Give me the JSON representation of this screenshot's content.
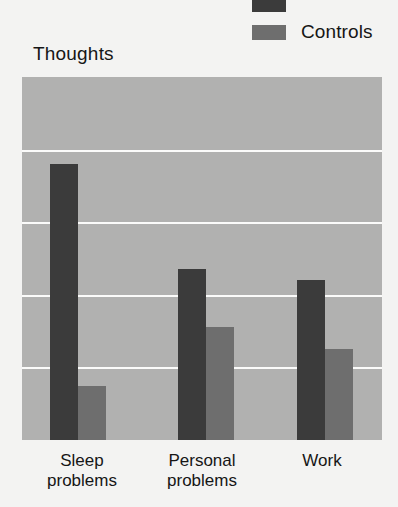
{
  "chart_title": "Thoughts",
  "legend": {
    "position": "top-right",
    "entries": [
      {
        "label": "",
        "color": "#3b3b3b",
        "name": "patients",
        "clipped": true
      },
      {
        "label": "Controls",
        "color": "#6e6e6e",
        "name": "controls",
        "clipped": false
      }
    ]
  },
  "axis": {
    "gridline_count": 4,
    "gridline_color": "#fbfbfa",
    "plot_background": "#b1b1b0"
  },
  "chart_data": {
    "type": "bar",
    "title": "Thoughts",
    "xlabel": "",
    "ylabel": "",
    "categories": [
      "Sleep problems",
      "Personal problems",
      "Work"
    ],
    "category_lines": [
      [
        "Sleep",
        "problems"
      ],
      [
        "Personal",
        "problems"
      ],
      [
        "Work",
        ""
      ]
    ],
    "series": [
      {
        "name": "Patients",
        "color": "#3b3b3b",
        "values": [
          0.76,
          0.47,
          0.44
        ]
      },
      {
        "name": "Controls",
        "color": "#6e6e6e",
        "values": [
          0.15,
          0.31,
          0.25
        ]
      }
    ],
    "ylim": [
      0,
      1
    ],
    "grid": true,
    "gridline_values": [
      0.2,
      0.4,
      0.6,
      0.8
    ],
    "legend_position": "top-right"
  }
}
